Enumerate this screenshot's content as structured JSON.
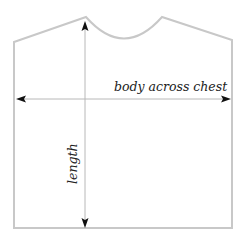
{
  "diagram": {
    "title": "",
    "type": "garment-schematic",
    "garment": "sweater body",
    "labels": {
      "width": "body across chest",
      "length": "length"
    },
    "colors": {
      "outline": "#c8c8c8",
      "measure_line": "#b8b8b8",
      "arrowhead": "#111111",
      "text": "#222222"
    }
  }
}
